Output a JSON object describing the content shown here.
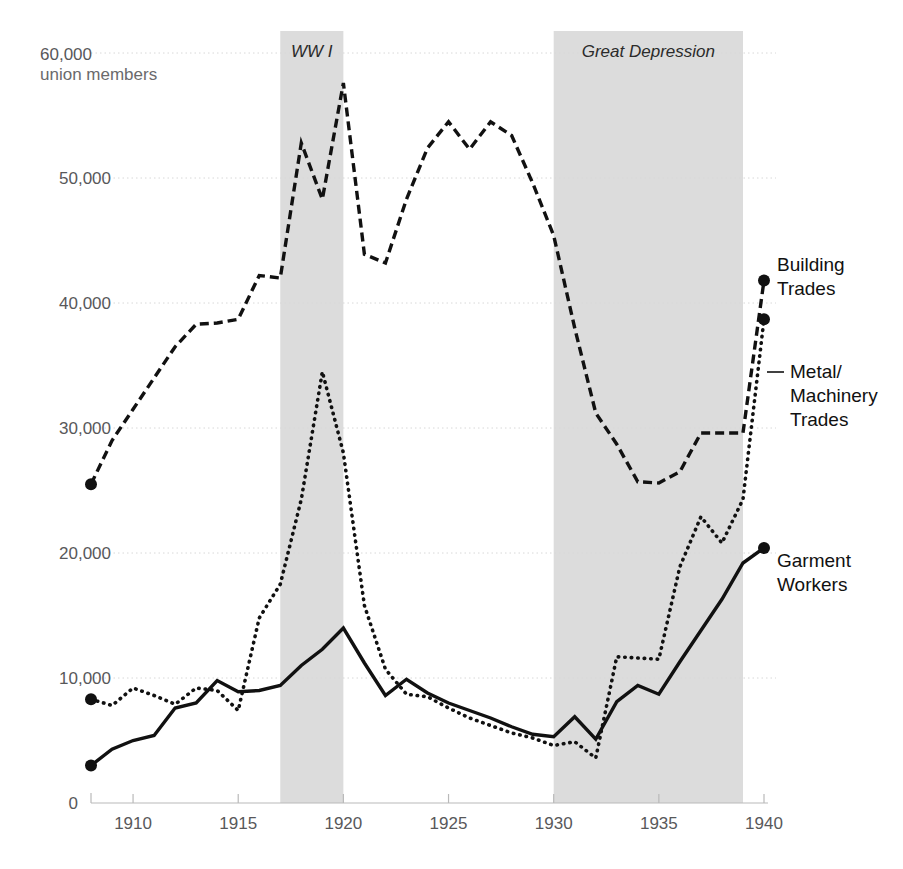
{
  "chart_data": {
    "type": "line",
    "title": "",
    "subtitle": "",
    "xlabel": "",
    "ylabel": "union members",
    "y_axis_caption_top": "60,000",
    "y_axis_caption_sub": "union members",
    "xlim": [
      1908,
      1940
    ],
    "ylim": [
      0,
      60000
    ],
    "grid": true,
    "legend_position": "right-inline-labels",
    "yticks": [
      0,
      10000,
      20000,
      30000,
      40000,
      50000,
      60000
    ],
    "ytick_labels": [
      "0",
      "10,000",
      "20,000",
      "30,000",
      "40,000",
      "50,000",
      "60,000"
    ],
    "xticks": [
      1910,
      1915,
      1920,
      1925,
      1930,
      1935,
      1940
    ],
    "xtick_labels": [
      "1910",
      "1915",
      "1920",
      "1925",
      "1930",
      "1935",
      "1940"
    ],
    "x": [
      1908,
      1909,
      1910,
      1911,
      1912,
      1913,
      1914,
      1915,
      1916,
      1917,
      1918,
      1919,
      1920,
      1921,
      1922,
      1923,
      1924,
      1925,
      1926,
      1927,
      1928,
      1929,
      1930,
      1931,
      1932,
      1933,
      1934,
      1935,
      1936,
      1937,
      1938,
      1939,
      1940
    ],
    "series": [
      {
        "name": "Building Trades",
        "style": "dashed",
        "label_lines": [
          "Building",
          "Trades"
        ],
        "endpoint_marker": true,
        "values": [
          25500,
          29000,
          31500,
          34000,
          36500,
          38300,
          38400,
          38700,
          42200,
          42000,
          52800,
          48300,
          57600,
          43900,
          43200,
          48300,
          52400,
          54500,
          52300,
          54500,
          53400,
          49600,
          45400,
          38000,
          31200,
          28700,
          25700,
          25600,
          26500,
          29600,
          29600,
          29600,
          41800
        ]
      },
      {
        "name": "Metal/Machinery Trades",
        "style": "dotted",
        "label_lines": [
          "Metal/",
          "Machinery",
          "Trades"
        ],
        "endpoint_marker": true,
        "values": [
          8300,
          7800,
          9200,
          8600,
          7900,
          9200,
          9000,
          7400,
          14800,
          17500,
          24300,
          34500,
          28000,
          15800,
          10700,
          8700,
          8500,
          7600,
          6800,
          6200,
          5600,
          5200,
          4600,
          4900,
          3600,
          11700,
          11600,
          11500,
          18900,
          22900,
          20800,
          24300,
          38700
        ]
      },
      {
        "name": "Garment Workers",
        "style": "solid",
        "label_lines": [
          "Garment",
          "Workers"
        ],
        "endpoint_marker": true,
        "values": [
          3000,
          4300,
          5000,
          5400,
          7600,
          8000,
          9800,
          8900,
          9000,
          9400,
          11000,
          12300,
          14000,
          11200,
          8600,
          9900,
          8800,
          8000,
          7400,
          6800,
          6100,
          5500,
          5300,
          6900,
          5100,
          8100,
          9400,
          8700,
          11300,
          13800,
          16300,
          19200,
          20400
        ]
      }
    ],
    "annotation_bands": [
      {
        "label": "WW I",
        "start": 1917,
        "end": 1920
      },
      {
        "label": "Great Depression",
        "start": 1930,
        "end": 1939
      }
    ]
  }
}
